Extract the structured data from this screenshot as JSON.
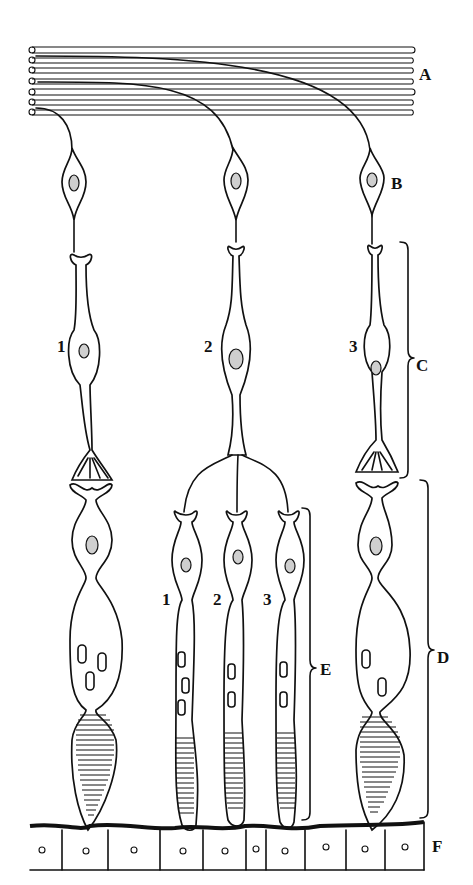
{
  "diagram": {
    "title": "",
    "layer_labels": {
      "A": "A",
      "B": "B",
      "C": "C",
      "D": "D",
      "E": "E",
      "F": "F"
    },
    "upper_cell_numbers": [
      "1",
      "2",
      "3"
    ],
    "lower_cell_numbers": [
      "1",
      "2",
      "3"
    ],
    "colors": {
      "ink": "#111111",
      "background": "#ffffff",
      "nucleus_fill": "#cfcfcf"
    }
  }
}
